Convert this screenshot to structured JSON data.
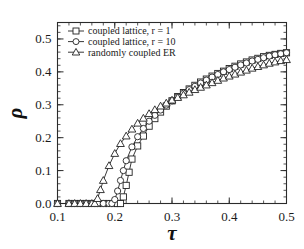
{
  "chart_data": {
    "type": "line",
    "title": "",
    "xlabel": "τ",
    "ylabel": "ρ",
    "xlim": [
      0.1,
      0.5
    ],
    "ylim": [
      0.0,
      0.55
    ],
    "xticks": [
      "0.1",
      "0.2",
      "0.3",
      "0.4",
      "0.5"
    ],
    "xtick_values": [
      0.1,
      0.2,
      0.3,
      0.4,
      0.5
    ],
    "yticks": [
      "0.0",
      "0.1",
      "0.2",
      "0.3",
      "0.4",
      "0.5"
    ],
    "ytick_values": [
      0.0,
      0.1,
      0.2,
      0.3,
      0.4,
      0.5
    ],
    "grid": false,
    "legend_position": "upper left",
    "series": [
      {
        "name": "coupled lattice, r = 1",
        "marker": "square",
        "x": [
          0.1,
          0.12,
          0.13,
          0.14,
          0.15,
          0.16,
          0.17,
          0.18,
          0.19,
          0.2,
          0.205,
          0.21,
          0.215,
          0.22,
          0.225,
          0.23,
          0.24,
          0.25,
          0.26,
          0.27,
          0.28,
          0.29,
          0.3,
          0.31,
          0.32,
          0.33,
          0.34,
          0.35,
          0.36,
          0.37,
          0.38,
          0.39,
          0.4,
          0.41,
          0.42,
          0.43,
          0.44,
          0.45,
          0.46,
          0.47,
          0.48,
          0.49,
          0.5
        ],
        "y": [
          0.0,
          0.0,
          0.0,
          0.0,
          0.0,
          0.0,
          0.0,
          0.0,
          0.0,
          0.0,
          0.0,
          0.0,
          0.02,
          0.055,
          0.095,
          0.135,
          0.175,
          0.205,
          0.235,
          0.258,
          0.278,
          0.296,
          0.312,
          0.325,
          0.337,
          0.348,
          0.359,
          0.369,
          0.378,
          0.387,
          0.395,
          0.402,
          0.41,
          0.417,
          0.424,
          0.43,
          0.436,
          0.441,
          0.446,
          0.45,
          0.453,
          0.456,
          0.458
        ]
      },
      {
        "name": "coupled lattice, r = 10",
        "marker": "circle",
        "x": [
          0.1,
          0.12,
          0.13,
          0.14,
          0.15,
          0.16,
          0.17,
          0.18,
          0.19,
          0.195,
          0.2,
          0.205,
          0.21,
          0.215,
          0.22,
          0.23,
          0.24,
          0.25,
          0.26,
          0.27,
          0.28,
          0.29,
          0.3,
          0.31,
          0.32,
          0.33,
          0.34,
          0.35,
          0.36,
          0.37,
          0.38,
          0.39,
          0.4,
          0.41,
          0.42,
          0.43,
          0.44,
          0.45,
          0.46,
          0.47,
          0.48,
          0.49,
          0.5
        ],
        "y": [
          0.0,
          0.0,
          0.0,
          0.0,
          0.0,
          0.0,
          0.0,
          0.0,
          0.0,
          0.0,
          0.012,
          0.038,
          0.07,
          0.1,
          0.13,
          0.172,
          0.203,
          0.228,
          0.25,
          0.268,
          0.284,
          0.299,
          0.312,
          0.324,
          0.335,
          0.346,
          0.356,
          0.366,
          0.375,
          0.384,
          0.392,
          0.4,
          0.407,
          0.414,
          0.421,
          0.427,
          0.433,
          0.438,
          0.443,
          0.448,
          0.452,
          0.455,
          0.458
        ]
      },
      {
        "name": "randomly coupled ER",
        "marker": "triangle",
        "x": [
          0.1,
          0.12,
          0.13,
          0.14,
          0.15,
          0.16,
          0.165,
          0.17,
          0.175,
          0.18,
          0.19,
          0.2,
          0.21,
          0.22,
          0.23,
          0.24,
          0.25,
          0.26,
          0.27,
          0.28,
          0.29,
          0.3,
          0.31,
          0.32,
          0.33,
          0.34,
          0.35,
          0.36,
          0.37,
          0.38,
          0.39,
          0.4,
          0.41,
          0.42,
          0.43,
          0.44,
          0.45,
          0.46,
          0.47,
          0.48,
          0.49,
          0.5
        ],
        "y": [
          0.0,
          0.0,
          0.0,
          0.0,
          0.0,
          0.0,
          0.0,
          0.015,
          0.042,
          0.07,
          0.115,
          0.152,
          0.182,
          0.205,
          0.226,
          0.244,
          0.259,
          0.273,
          0.285,
          0.296,
          0.305,
          0.314,
          0.322,
          0.33,
          0.338,
          0.346,
          0.353,
          0.36,
          0.367,
          0.374,
          0.381,
          0.387,
          0.393,
          0.399,
          0.405,
          0.411,
          0.416,
          0.421,
          0.426,
          0.43,
          0.434,
          0.437
        ]
      }
    ]
  },
  "legend": {
    "entries": [
      {
        "label": "coupled lattice, r = 1",
        "marker": "square"
      },
      {
        "label": "coupled lattice, r = 10",
        "marker": "circle"
      },
      {
        "label": "randomly coupled ER",
        "marker": "triangle"
      }
    ]
  },
  "colors": {
    "axis": "#2b2b2b",
    "line": "#222222",
    "marker_fill": "#ffffff",
    "background": "#ffffff"
  }
}
